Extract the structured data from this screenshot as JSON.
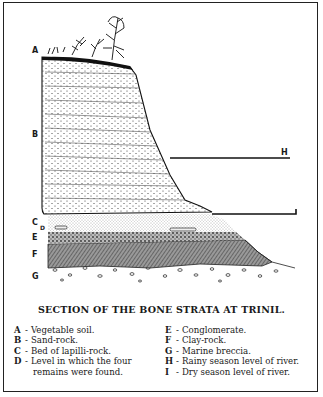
{
  "figure": {
    "title": "SECTION OF THE BONE STRATA AT TRINIL.",
    "labels": {
      "A": "A",
      "B": "B",
      "C": "C",
      "D": "D",
      "E": "E",
      "F": "F",
      "G": "G",
      "H": "H",
      "I": "I"
    }
  },
  "legend": {
    "left": [
      {
        "key": "A",
        "text": "Vegetable soil."
      },
      {
        "key": "B",
        "text": "Sand-rock."
      },
      {
        "key": "C",
        "text": "Bed of lapilli-rock."
      },
      {
        "key": "D",
        "text": "Level in which the four",
        "continuation": "remains were found."
      }
    ],
    "right": [
      {
        "key": "E",
        "text": "Conglomerate."
      },
      {
        "key": "F",
        "text": "Clay-rock."
      },
      {
        "key": "G",
        "text": "Marine breccia."
      },
      {
        "key": "H",
        "text": "Rainy season level of river."
      },
      {
        "key": "I",
        "text": "Dry season level of river."
      }
    ]
  },
  "dash": "-"
}
